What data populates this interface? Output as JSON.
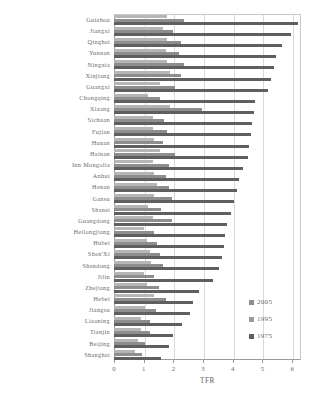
{
  "chart_data": {
    "type": "bar",
    "orientation": "horizontal",
    "title": "",
    "xlabel": "TFR",
    "ylabel": "",
    "xlim": [
      0,
      6.3
    ],
    "xticks": [
      0,
      1,
      2,
      3,
      4,
      5,
      6
    ],
    "xticklabels": [
      "0",
      "1",
      "2",
      "3",
      "4",
      "5",
      "6"
    ],
    "grid": true,
    "legend_position": "right-bottom",
    "categories": [
      "Guizhou",
      "Jiangxi",
      "Qinghai",
      "Yunnan",
      "Ningxia",
      "Xinjiang",
      "Guangxi",
      "Chongqing",
      "Xizang",
      "Sichuan",
      "Fujian",
      "Hunan",
      "Hainan",
      "Inn Mongolia",
      "Anhui",
      "Henan",
      "Gansu",
      "Shansi",
      "Guangdong",
      "Heilongjiang",
      "Hubei",
      "Shan'Xi",
      "Shandong",
      "Jilin",
      "Zhejiang",
      "Hebei",
      "Jiangsu",
      "Liaoning",
      "Tianjin",
      "Beijing",
      "Shanghai"
    ],
    "series": [
      {
        "name": "2005",
        "color": "#b6b6b6",
        "values": [
          1.8,
          1.65,
          1.8,
          1.75,
          1.8,
          1.9,
          1.55,
          1.15,
          1.9,
          1.3,
          1.3,
          1.35,
          1.55,
          1.3,
          1.35,
          1.45,
          1.35,
          1.15,
          1.3,
          1.0,
          1.1,
          1.2,
          1.25,
          1.0,
          1.1,
          1.35,
          1.05,
          0.9,
          0.9,
          0.8,
          0.7
        ]
      },
      {
        "name": "1995",
        "color": "#8e8e8e",
        "values": [
          2.35,
          2.0,
          2.25,
          2.2,
          2.35,
          2.25,
          2.05,
          1.55,
          2.95,
          1.7,
          1.8,
          1.65,
          2.05,
          1.85,
          1.75,
          1.85,
          1.95,
          1.6,
          1.95,
          1.35,
          1.45,
          1.55,
          1.65,
          1.35,
          1.5,
          1.75,
          1.4,
          1.2,
          1.2,
          1.05,
          0.95
        ]
      },
      {
        "name": "1975",
        "color": "#5f5f5f",
        "values": [
          6.2,
          5.95,
          5.65,
          5.45,
          5.4,
          5.3,
          5.2,
          4.75,
          4.7,
          4.65,
          4.6,
          4.55,
          4.5,
          4.35,
          4.2,
          4.15,
          4.05,
          3.95,
          3.8,
          3.75,
          3.7,
          3.65,
          3.55,
          3.35,
          2.85,
          2.65,
          2.55,
          2.3,
          2.0,
          1.85,
          1.6
        ]
      }
    ]
  },
  "legend": {
    "items": [
      {
        "label": "2005"
      },
      {
        "label": "1995"
      },
      {
        "label": "1975"
      }
    ]
  }
}
